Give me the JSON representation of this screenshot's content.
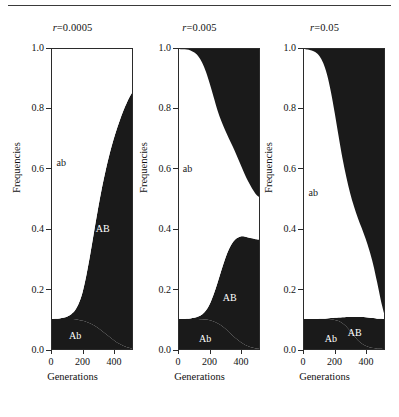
{
  "figure": {
    "yaxis_title": "Frequencies",
    "xaxis_title": "Generations"
  },
  "chart_data": [
    {
      "type": "area",
      "title": "r=0.0005",
      "title_param": "r",
      "title_value": "0.0005",
      "xlabel": "Generations",
      "ylabel": "Frequencies",
      "xlim": [
        0,
        520
      ],
      "ylim": [
        0.0,
        1.0
      ],
      "xticks": [
        0,
        200,
        400
      ],
      "xtick_labels": [
        "0",
        "200",
        "400"
      ],
      "yticks": [
        0.0,
        0.2,
        0.4,
        0.6,
        0.8,
        1.0
      ],
      "ytick_labels": [
        "0.0",
        "0.2",
        "0.4",
        "0.6",
        "0.8",
        "1.0"
      ],
      "grid": false,
      "legend": "in-plot annotations",
      "annotations": [
        {
          "text": "ab",
          "x": 60,
          "y": 0.62,
          "color": "#1a1a1a"
        },
        {
          "text": "AB",
          "x": 330,
          "y": 0.4,
          "color": "#ffffff"
        },
        {
          "text": "Ab",
          "x": 150,
          "y": 0.045,
          "color": "#ffffff"
        }
      ],
      "x": [
        0,
        25,
        50,
        75,
        100,
        125,
        150,
        175,
        200,
        225,
        250,
        275,
        300,
        325,
        350,
        375,
        400,
        425,
        450,
        475,
        500,
        520
      ],
      "series": [
        {
          "name": "Ab",
          "color": "#1a1a1a",
          "values": [
            0.1,
            0.1,
            0.1,
            0.1,
            0.1,
            0.1,
            0.099,
            0.097,
            0.094,
            0.09,
            0.085,
            0.078,
            0.07,
            0.06,
            0.05,
            0.04,
            0.03,
            0.021,
            0.014,
            0.008,
            0.004,
            0.002
          ]
        },
        {
          "name": "AB",
          "color": "#1a1a1a",
          "values": [
            0.0,
            0.001,
            0.002,
            0.004,
            0.008,
            0.016,
            0.03,
            0.056,
            0.098,
            0.16,
            0.235,
            0.318,
            0.4,
            0.478,
            0.548,
            0.612,
            0.668,
            0.718,
            0.762,
            0.8,
            0.832,
            0.852
          ]
        },
        {
          "name": "ab",
          "color": "#ffffff",
          "values": [
            0.9,
            0.899,
            0.898,
            0.896,
            0.892,
            0.884,
            0.871,
            0.847,
            0.808,
            0.75,
            0.68,
            0.604,
            0.53,
            0.462,
            0.402,
            0.348,
            0.302,
            0.261,
            0.224,
            0.192,
            0.164,
            0.146
          ]
        },
        {
          "name": "aB",
          "color": "#1a1a1a",
          "values": [
            0.0,
            0.0,
            0.0,
            0.0,
            0.0,
            0.0,
            0.0,
            0.0,
            0.0,
            0.0,
            0.0,
            0.0,
            0.0,
            0.0,
            0.0,
            0.0,
            0.0,
            0.0,
            0.0,
            0.0,
            0.0,
            0.0
          ]
        }
      ]
    },
    {
      "type": "area",
      "title": "r=0.005",
      "title_param": "r",
      "title_value": "0.005",
      "xlabel": "Generations",
      "ylabel": "Frequencies",
      "xlim": [
        0,
        520
      ],
      "ylim": [
        0.0,
        1.0
      ],
      "xticks": [
        0,
        200,
        400
      ],
      "xtick_labels": [
        "0",
        "200",
        "400"
      ],
      "yticks": [
        0.0,
        0.2,
        0.4,
        0.6,
        0.8,
        1.0
      ],
      "ytick_labels": [
        "0.0",
        "0.2",
        "0.4",
        "0.6",
        "0.8",
        "1.0"
      ],
      "grid": false,
      "legend": "in-plot annotations",
      "annotations": [
        {
          "text": "ab",
          "x": 55,
          "y": 0.6,
          "color": "#1a1a1a"
        },
        {
          "text": "AB",
          "x": 330,
          "y": 0.17,
          "color": "#ffffff"
        },
        {
          "text": "Ab",
          "x": 170,
          "y": 0.035,
          "color": "#ffffff"
        }
      ],
      "x": [
        0,
        25,
        50,
        75,
        100,
        125,
        150,
        175,
        200,
        225,
        250,
        275,
        300,
        325,
        350,
        375,
        400,
        425,
        450,
        475,
        500,
        520
      ],
      "series": [
        {
          "name": "Ab",
          "color": "#1a1a1a",
          "values": [
            0.1,
            0.1,
            0.1,
            0.1,
            0.1,
            0.1,
            0.099,
            0.098,
            0.096,
            0.092,
            0.086,
            0.078,
            0.068,
            0.056,
            0.044,
            0.033,
            0.023,
            0.015,
            0.009,
            0.005,
            0.002,
            0.001
          ]
        },
        {
          "name": "AB",
          "color": "#1a1a1a",
          "values": [
            0.0,
            0.0,
            0.001,
            0.002,
            0.004,
            0.008,
            0.016,
            0.03,
            0.054,
            0.09,
            0.134,
            0.184,
            0.233,
            0.277,
            0.312,
            0.336,
            0.352,
            0.36,
            0.363,
            0.364,
            0.364,
            0.364
          ]
        },
        {
          "name": "ab",
          "color": "#ffffff",
          "values": [
            0.9,
            0.899,
            0.897,
            0.893,
            0.884,
            0.868,
            0.84,
            0.796,
            0.734,
            0.658,
            0.576,
            0.498,
            0.428,
            0.368,
            0.318,
            0.276,
            0.24,
            0.21,
            0.186,
            0.166,
            0.15,
            0.142
          ]
        },
        {
          "name": "aB",
          "color": "#1a1a1a",
          "values": [
            0.0,
            0.001,
            0.002,
            0.005,
            0.012,
            0.024,
            0.045,
            0.076,
            0.116,
            0.16,
            0.204,
            0.24,
            0.271,
            0.299,
            0.326,
            0.355,
            0.385,
            0.415,
            0.442,
            0.465,
            0.484,
            0.493
          ]
        }
      ]
    },
    {
      "type": "area",
      "title": "r=0.05",
      "title_param": "r",
      "title_value": "0.05",
      "xlabel": "Generations",
      "ylabel": "Frequencies",
      "xlim": [
        0,
        520
      ],
      "ylim": [
        0.0,
        1.0
      ],
      "xticks": [
        0,
        200,
        400
      ],
      "xtick_labels": [
        "0",
        "200",
        "400"
      ],
      "yticks": [
        0.0,
        0.2,
        0.4,
        0.6,
        0.8,
        1.0
      ],
      "ytick_labels": [
        "0.0",
        "0.2",
        "0.4",
        "0.6",
        "0.8",
        "1.0"
      ],
      "grid": false,
      "legend": "in-plot annotations",
      "annotations": [
        {
          "text": "ab",
          "x": 60,
          "y": 0.52,
          "color": "#1a1a1a"
        },
        {
          "text": "AB",
          "x": 330,
          "y": 0.055,
          "color": "#ffffff"
        },
        {
          "text": "Ab",
          "x": 175,
          "y": 0.035,
          "color": "#ffffff"
        }
      ],
      "x": [
        0,
        25,
        50,
        75,
        100,
        125,
        150,
        175,
        200,
        225,
        250,
        275,
        300,
        325,
        350,
        375,
        400,
        425,
        450,
        475,
        500,
        520
      ],
      "series": [
        {
          "name": "Ab",
          "color": "#1a1a1a",
          "values": [
            0.1,
            0.1,
            0.1,
            0.1,
            0.1,
            0.1,
            0.1,
            0.099,
            0.097,
            0.093,
            0.086,
            0.075,
            0.06,
            0.044,
            0.029,
            0.018,
            0.011,
            0.006,
            0.003,
            0.001,
            0.001,
            0.0
          ]
        },
        {
          "name": "AB",
          "color": "#1a1a1a",
          "values": [
            0.0,
            0.0,
            0.0,
            0.0,
            0.001,
            0.001,
            0.002,
            0.004,
            0.007,
            0.012,
            0.02,
            0.032,
            0.047,
            0.063,
            0.078,
            0.089,
            0.095,
            0.098,
            0.1,
            0.1,
            0.1,
            0.1
          ]
        },
        {
          "name": "ab",
          "color": "#ffffff",
          "values": [
            0.9,
            0.898,
            0.895,
            0.889,
            0.876,
            0.852,
            0.812,
            0.754,
            0.682,
            0.604,
            0.53,
            0.466,
            0.412,
            0.368,
            0.33,
            0.296,
            0.262,
            0.224,
            0.178,
            0.122,
            0.06,
            0.02
          ]
        },
        {
          "name": "aB",
          "color": "#1a1a1a",
          "values": [
            0.0,
            0.002,
            0.005,
            0.011,
            0.023,
            0.047,
            0.086,
            0.143,
            0.214,
            0.291,
            0.364,
            0.427,
            0.481,
            0.525,
            0.563,
            0.597,
            0.632,
            0.672,
            0.719,
            0.777,
            0.839,
            0.88
          ]
        }
      ]
    }
  ]
}
